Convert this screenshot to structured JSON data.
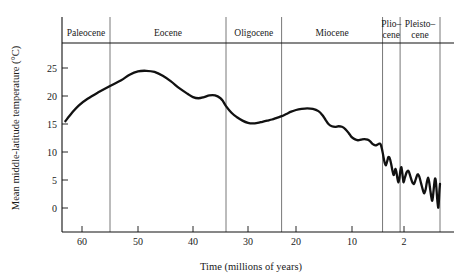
{
  "chart_data": {
    "type": "line",
    "title": "",
    "xlabel": "Time (millions of years)",
    "ylabel": "Mean middle-latitude temperature (°C)",
    "xticks": [
      60,
      50,
      40,
      30,
      20,
      10,
      2
    ],
    "xtick_labels": [
      "60",
      "50",
      "40",
      "30",
      "20",
      "10",
      "2"
    ],
    "yticks": [
      0,
      5,
      10,
      15,
      20,
      25
    ],
    "ytick_labels": [
      "0",
      "5",
      "10",
      "15",
      "20",
      "25"
    ],
    "ylim": [
      -2,
      28
    ],
    "xlim": [
      66,
      0
    ],
    "x_axis_reversed": true,
    "x_axis_nonlinear_after": 2,
    "grid": false,
    "legend": null,
    "series": [
      {
        "name": "Mean middle-latitude temperature",
        "color": "#111111",
        "points": [
          [
            65.0,
            15.5
          ],
          [
            63.0,
            17.0
          ],
          [
            61.0,
            18.3
          ],
          [
            59.0,
            19.5
          ],
          [
            57.0,
            20.7
          ],
          [
            55.0,
            21.8
          ],
          [
            53.0,
            22.8
          ],
          [
            51.5,
            23.8
          ],
          [
            50.0,
            24.4
          ],
          [
            48.5,
            24.5
          ],
          [
            47.0,
            24.3
          ],
          [
            45.5,
            23.6
          ],
          [
            44.0,
            22.6
          ],
          [
            42.5,
            21.4
          ],
          [
            41.0,
            20.4
          ],
          [
            40.0,
            19.8
          ],
          [
            39.0,
            19.6
          ],
          [
            38.0,
            19.8
          ],
          [
            37.0,
            20.1
          ],
          [
            36.0,
            20.1
          ],
          [
            35.0,
            19.6
          ],
          [
            34.5,
            19.0
          ],
          [
            34.0,
            18.2
          ],
          [
            33.0,
            17.0
          ],
          [
            32.0,
            16.2
          ],
          [
            31.0,
            15.6
          ],
          [
            30.0,
            15.2
          ],
          [
            29.0,
            15.1
          ],
          [
            28.0,
            15.2
          ],
          [
            27.0,
            15.4
          ],
          [
            26.0,
            15.6
          ],
          [
            25.0,
            15.8
          ],
          [
            24.0,
            16.1
          ],
          [
            23.0,
            16.4
          ],
          [
            22.0,
            16.8
          ],
          [
            21.0,
            17.2
          ],
          [
            20.0,
            17.5
          ],
          [
            19.0,
            17.7
          ],
          [
            18.0,
            17.8
          ],
          [
            17.0,
            17.7
          ],
          [
            16.0,
            17.3
          ],
          [
            15.3,
            16.6
          ],
          [
            14.7,
            15.7
          ],
          [
            14.2,
            15.0
          ],
          [
            13.6,
            14.6
          ],
          [
            13.0,
            14.5
          ],
          [
            12.4,
            14.6
          ],
          [
            11.8,
            14.5
          ],
          [
            11.2,
            14.1
          ],
          [
            10.6,
            13.4
          ],
          [
            10.1,
            12.7
          ],
          [
            9.6,
            12.3
          ],
          [
            9.1,
            12.1
          ],
          [
            8.6,
            12.2
          ],
          [
            8.1,
            12.3
          ],
          [
            7.6,
            12.2
          ],
          [
            7.2,
            11.9
          ],
          [
            6.8,
            11.4
          ],
          [
            6.4,
            11.2
          ],
          [
            6.1,
            11.3
          ],
          [
            5.8,
            11.5
          ],
          [
            5.6,
            11.4
          ],
          [
            5.4,
            10.6
          ],
          [
            5.2,
            9.4
          ],
          [
            5.0,
            8.2
          ],
          [
            4.8,
            7.6
          ],
          [
            4.6,
            8.3
          ],
          [
            4.4,
            9.1
          ],
          [
            4.2,
            8.9
          ],
          [
            4.0,
            8.0
          ],
          [
            3.8,
            6.8
          ],
          [
            3.6,
            5.9
          ],
          [
            3.45,
            6.4
          ],
          [
            3.3,
            7.0
          ],
          [
            3.15,
            6.3
          ],
          [
            3.0,
            5.2
          ],
          [
            2.85,
            4.6
          ],
          [
            2.7,
            5.4
          ],
          [
            2.55,
            6.7
          ],
          [
            2.4,
            7.3
          ],
          [
            2.28,
            6.4
          ],
          [
            2.15,
            5.2
          ],
          [
            2.05,
            4.6
          ],
          [
            1.95,
            5.4
          ],
          [
            1.85,
            6.4
          ],
          [
            1.75,
            6.6
          ],
          [
            1.65,
            5.7
          ],
          [
            1.55,
            4.7
          ],
          [
            1.45,
            4.3
          ],
          [
            1.35,
            5.1
          ],
          [
            1.25,
            6.0
          ],
          [
            1.15,
            5.6
          ],
          [
            1.05,
            4.4
          ],
          [
            0.95,
            3.2
          ],
          [
            0.88,
            2.6
          ],
          [
            0.8,
            3.3
          ],
          [
            0.73,
            4.6
          ],
          [
            0.66,
            5.4
          ],
          [
            0.6,
            4.6
          ],
          [
            0.54,
            3.2
          ],
          [
            0.48,
            1.9
          ],
          [
            0.43,
            1.3
          ],
          [
            0.38,
            2.4
          ],
          [
            0.33,
            4.0
          ],
          [
            0.28,
            5.2
          ],
          [
            0.24,
            5.0
          ],
          [
            0.2,
            3.6
          ],
          [
            0.16,
            1.8
          ],
          [
            0.12,
            0.5
          ],
          [
            0.09,
            0.1
          ],
          [
            0.06,
            1.4
          ],
          [
            0.03,
            3.2
          ],
          [
            0.0,
            4.3
          ]
        ]
      }
    ],
    "epochs": [
      {
        "name": "Paleocene",
        "label_lines": [
          "Paleocene"
        ],
        "start_ma": 66,
        "end_ma": 55
      },
      {
        "name": "Eocene",
        "label_lines": [
          "Eocene"
        ],
        "start_ma": 55,
        "end_ma": 34
      },
      {
        "name": "Oligocene",
        "label_lines": [
          "Oligocene"
        ],
        "start_ma": 34,
        "end_ma": 23
      },
      {
        "name": "Miocene",
        "label_lines": [
          "Miocene"
        ],
        "start_ma": 23,
        "end_ma": 5.3
      },
      {
        "name": "Pliocene",
        "label_lines": [
          "Plio–",
          "cene"
        ],
        "start_ma": 5.3,
        "end_ma": 2.6
      },
      {
        "name": "Pleistocene",
        "label_lines": [
          "Pleisto–",
          "cene"
        ],
        "start_ma": 2.6,
        "end_ma": 0
      }
    ]
  }
}
